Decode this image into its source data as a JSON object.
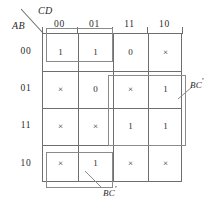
{
  "axes": {
    "column_variable_label": "CD",
    "row_variable_label": "AB",
    "column_headers": [
      "00",
      "01",
      "11",
      "10"
    ],
    "row_headers": [
      "00",
      "01",
      "11",
      "10"
    ]
  },
  "cells": [
    [
      "1",
      "1",
      "0",
      "×"
    ],
    [
      "×",
      "0",
      "×",
      "1"
    ],
    [
      "×",
      "×",
      "1",
      "1"
    ],
    [
      "×",
      "1",
      "×",
      "×"
    ]
  ],
  "groups": [
    {
      "name": "top-left-group",
      "label": "BC",
      "prime": "′",
      "cells": [
        "AB=00,CD=00",
        "AB=00,CD=01"
      ],
      "has_label": false
    },
    {
      "name": "right-group",
      "label": "BC",
      "prime": "′",
      "cells": [
        "AB=01,CD=11",
        "AB=01,CD=10",
        "AB=11,CD=11",
        "AB=11,CD=10"
      ],
      "has_label": true
    },
    {
      "name": "bottom-left-group",
      "label": "BC",
      "prime": "′",
      "cells": [
        "AB=10,CD=00",
        "AB=10,CD=01"
      ],
      "has_label": true
    }
  ],
  "colors": {
    "grid_line": "#6e6e6e",
    "group_line": "#8a8a8a",
    "text": "#2b2b2b",
    "background": "#ffffff"
  }
}
